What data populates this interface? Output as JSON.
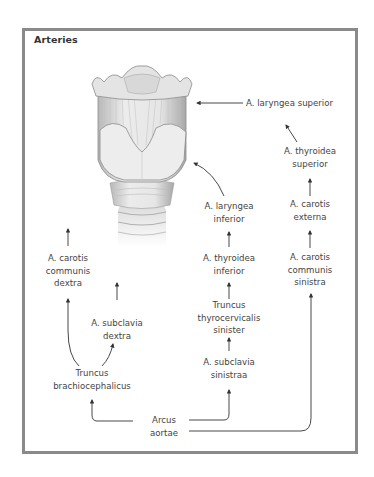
{
  "diagram": {
    "title": "Arteries",
    "illustration": {
      "subject": "larynx-anterior-view",
      "colors": {
        "cartilage_light": "#eeeeee",
        "cartilage_mid": "#c9c9c9",
        "cartilage_dark": "#9a9a9a",
        "outline": "#8c8c8c"
      }
    },
    "labels": {
      "laryngea_superior": [
        "A. laryngea superior"
      ],
      "thyroidea_superior": [
        "A. thyroidea",
        "superior"
      ],
      "laryngea_inferior": [
        "A. laryngea",
        "inferior"
      ],
      "carotis_externa": [
        "A. carotis",
        "externa"
      ],
      "carotis_communis_dextra": [
        "A. carotis",
        "communis",
        "dextra"
      ],
      "thyroidea_inferior": [
        "A. thyroidea",
        "inferior"
      ],
      "carotis_communis_sinistra": [
        "A. carotis",
        "communis",
        "sinistra"
      ],
      "subclavia_dextra": [
        "A. subclavia",
        "dextra"
      ],
      "truncus_thyrocervicalis": [
        "Truncus",
        "thyrocervicalis",
        "sinister"
      ],
      "subclavia_sinistra": [
        "A. subclavia",
        "sinistraa"
      ],
      "truncus_brachiocephalicus": [
        "Truncus",
        "brachiocephalicus"
      ],
      "arcus_aortae": [
        "Arcus",
        "aortae"
      ]
    },
    "colors": {
      "frame": "#8a8a8a",
      "arrow": "#333333",
      "text": "#444444"
    }
  }
}
